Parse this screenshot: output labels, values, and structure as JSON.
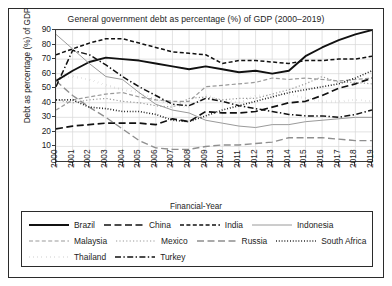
{
  "chart_data": {
    "type": "line",
    "title": "General government debt as percentage (%) of GDP (2000–2019)",
    "xlabel": "Financial-Year",
    "ylabel": "Debt as percentage (%) of GDP",
    "grid": true,
    "legend_position": "below",
    "xlim": [
      2000,
      2019
    ],
    "ylim": [
      0,
      90
    ],
    "yticks": [
      10,
      20,
      30,
      40,
      50,
      60,
      70,
      80,
      90
    ],
    "categories": [
      "2000",
      "2001",
      "2002",
      "2003",
      "2004",
      "2005",
      "2006",
      "2007",
      "2008",
      "2009",
      "2010",
      "2011",
      "2012",
      "2013",
      "2014",
      "2015",
      "2016",
      "2017",
      "2018",
      "2019"
    ],
    "series": [
      {
        "name": "Brazil",
        "color": "#111111",
        "style": "solid",
        "width": 1.9,
        "values": [
          55,
          62,
          68,
          71,
          70,
          69,
          67,
          65,
          63,
          65,
          63,
          61,
          62,
          60,
          62,
          72,
          78,
          83,
          87,
          90
        ]
      },
      {
        "name": "China",
        "color": "#111111",
        "style": "longdash",
        "width": 1.7,
        "values": [
          22,
          24,
          25,
          26,
          26,
          26,
          25,
          29,
          27,
          34,
          33,
          33,
          34,
          37,
          40,
          41,
          45,
          50,
          53,
          57
        ]
      },
      {
        "name": "India",
        "color": "#111111",
        "style": "dash",
        "width": 1.5,
        "values": [
          73,
          77,
          81,
          84,
          84,
          81,
          78,
          75,
          74,
          73,
          67,
          69,
          69,
          68,
          67,
          69,
          69,
          70,
          70,
          72
        ]
      },
      {
        "name": "Indonesia",
        "color": "#9a9a9a",
        "style": "solid",
        "width": 1.0,
        "values": [
          87,
          77,
          67,
          58,
          56,
          47,
          39,
          35,
          33,
          28,
          26,
          24,
          23,
          25,
          25,
          27,
          28,
          29,
          30,
          30
        ]
      },
      {
        "name": "Malaysia",
        "color": "#9a9a9a",
        "style": "dash",
        "width": 1.2,
        "values": [
          35,
          42,
          44,
          46,
          47,
          44,
          42,
          41,
          41,
          51,
          52,
          53,
          54,
          57,
          56,
          57,
          56,
          55,
          56,
          57
        ]
      },
      {
        "name": "Mexico",
        "color": "#9a9a9a",
        "style": "dot",
        "width": 1.2,
        "values": [
          42,
          40,
          42,
          43,
          41,
          40,
          38,
          37,
          43,
          44,
          42,
          43,
          43,
          46,
          49,
          53,
          58,
          54,
          54,
          53
        ]
      },
      {
        "name": "Russia",
        "color": "#8f8f8f",
        "style": "longdash",
        "width": 1.4,
        "values": [
          55,
          45,
          37,
          30,
          22,
          14,
          9,
          8,
          8,
          10,
          11,
          11,
          12,
          13,
          16,
          16,
          16,
          15,
          14,
          14
        ]
      },
      {
        "name": "South Africa",
        "color": "#111111",
        "style": "finedot",
        "width": 1.6,
        "values": [
          42,
          42,
          37,
          36,
          34,
          34,
          32,
          28,
          27,
          31,
          35,
          38,
          41,
          44,
          47,
          49,
          51,
          53,
          57,
          62
        ]
      },
      {
        "name": "Thailand",
        "color": "#111111",
        "style": "squaredot",
        "width": 2.2,
        "values": [
          57,
          58,
          56,
          52,
          49,
          47,
          42,
          38,
          37,
          45,
          42,
          40,
          45,
          45,
          46,
          43,
          41,
          41,
          42,
          41
        ]
      },
      {
        "name": "Turkey",
        "color": "#111111",
        "style": "dashdot",
        "width": 1.5,
        "values": [
          51,
          76,
          73,
          66,
          58,
          51,
          45,
          39,
          38,
          43,
          41,
          38,
          36,
          34,
          32,
          31,
          31,
          30,
          32,
          35
        ]
      }
    ]
  },
  "legend": {
    "rows": [
      [
        {
          "label": "Brazil",
          "series": 0
        },
        {
          "label": "China",
          "series": 1
        },
        {
          "label": "India",
          "series": 2
        },
        {
          "label": "Indonesia",
          "series": 3
        }
      ],
      [
        {
          "label": "Malaysia",
          "series": 4
        },
        {
          "label": "Mexico",
          "series": 5
        },
        {
          "label": "Russia",
          "series": 6
        },
        {
          "label": "South Africa",
          "series": 7
        }
      ],
      [
        {
          "label": "Thailand",
          "series": 8
        },
        {
          "label": "Turkey",
          "series": 9
        }
      ]
    ]
  }
}
